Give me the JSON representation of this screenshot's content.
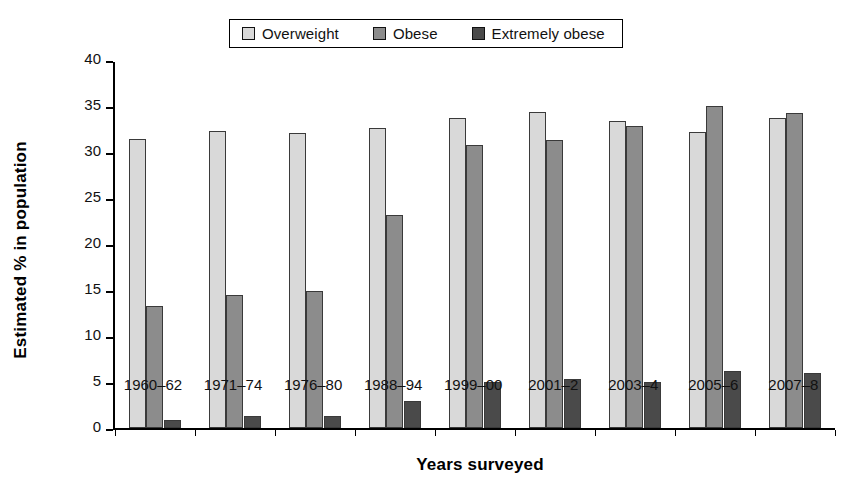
{
  "chart_data": {
    "type": "bar",
    "title": "",
    "xlabel": "Years surveyed",
    "ylabel": "Estimated % in population",
    "ylim": [
      0,
      40
    ],
    "yticks": [
      0,
      5,
      10,
      15,
      20,
      25,
      30,
      35,
      40
    ],
    "ytick_labels": [
      "0",
      "5",
      "10",
      "15",
      "20",
      "25",
      "30",
      "35",
      "40"
    ],
    "grid": false,
    "legend_position": "top-center",
    "categories": [
      "1960–62",
      "1971–74",
      "1976–80",
      "1988–94",
      "1999–00",
      "2001–2",
      "2003–4",
      "2005–6",
      "2007–8"
    ],
    "series": [
      {
        "name": "Overweight",
        "color": "#d9d9d9",
        "values": [
          31.5,
          32.3,
          32.1,
          32.7,
          33.7,
          34.4,
          33.4,
          32.2,
          33.7
        ]
      },
      {
        "name": "Obese",
        "color": "#8c8c8c",
        "values": [
          13.3,
          14.5,
          14.9,
          23.2,
          30.8,
          31.3,
          32.9,
          35.1,
          34.3
        ]
      },
      {
        "name": "Extremely obese",
        "color": "#4a4a4a",
        "values": [
          0.9,
          1.3,
          1.4,
          3.0,
          5.0,
          5.4,
          5.1,
          6.2,
          6.0
        ]
      }
    ]
  },
  "legend": {
    "items": [
      {
        "label": "Overweight",
        "color": "#d9d9d9"
      },
      {
        "label": "Obese",
        "color": "#8c8c8c"
      },
      {
        "label": "Extremely obese",
        "color": "#4a4a4a"
      }
    ]
  },
  "axes": {
    "y_title": "Estimated % in population",
    "x_title": "Years surveyed"
  }
}
